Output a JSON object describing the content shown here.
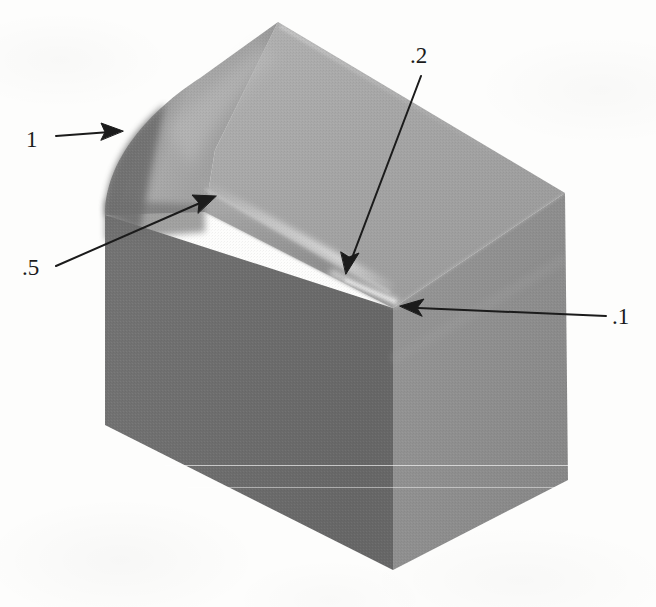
{
  "figure": {
    "domain": "technical-illustration",
    "background_color": "#fdfdfc",
    "canvas": {
      "width": 656,
      "height": 607
    }
  },
  "callouts": [
    {
      "id": "r1",
      "label": "1",
      "meaning": "fillet radius 1 on the upper-left vertical corner",
      "label_x": 26,
      "label_y": 128,
      "arrow": {
        "tail_x": 56,
        "tail_y": 136,
        "tip_x": 120,
        "tip_y": 131
      },
      "arrow_style": "straight-horizontal"
    },
    {
      "id": "r05",
      "label": ".5",
      "meaning": "fillet radius .5 on the left sloping edge",
      "label_x": 22,
      "label_y": 256,
      "arrow": {
        "tail_x": 56,
        "tail_y": 266,
        "tip_x": 215,
        "tip_y": 196
      },
      "arrow_style": "diagonal-up-right"
    },
    {
      "id": "r02",
      "label": ".2",
      "meaning": "fillet radius .2 on the front chamfer edge",
      "label_x": 410,
      "label_y": 44,
      "arrow": {
        "tail_x": 419,
        "tail_y": 73,
        "tip_x": 348,
        "tip_y": 272
      },
      "arrow_style": "diagonal-down-left"
    },
    {
      "id": "r01",
      "label": ".1",
      "meaning": "fillet radius .1 on the front vertical corner",
      "label_x": 612,
      "label_y": 305,
      "arrow": {
        "tail_x": 606,
        "tail_y": 316,
        "tip_x": 400,
        "tip_y": 306
      },
      "arrow_style": "straight-horizontal-left"
    }
  ],
  "shape": {
    "name": "filleted-block",
    "vertices": {
      "top_apex": {
        "x": 278,
        "y": 22
      },
      "top_right": {
        "x": 565,
        "y": 193
      },
      "front_vertex": {
        "x": 393,
        "y": 308
      },
      "left_upper": {
        "x": 105,
        "y": 215
      },
      "left_bottom": {
        "x": 105,
        "y": 425
      },
      "bottom_vertex": {
        "x": 393,
        "y": 570
      },
      "right_bottom": {
        "x": 568,
        "y": 480
      }
    },
    "faces": [
      {
        "name": "top-face",
        "fill": "#a3a3a3"
      },
      {
        "name": "left-front-face",
        "fill": "#6f6f6f"
      },
      {
        "name": "right-face",
        "fill": "#8f8f8f"
      },
      {
        "name": "left-fillet",
        "fill": "#9a9a9a"
      },
      {
        "name": "chamfer-band",
        "fill": "#989898"
      }
    ]
  },
  "artifacts": {
    "scan_lines": [
      {
        "y": 465,
        "x": 165,
        "width": 405
      },
      {
        "y": 487,
        "x": 188,
        "width": 382
      }
    ]
  },
  "colors": {
    "ink": "#1b1b1b",
    "paper": "#fdfdfc",
    "top_face": "#a3a3a3",
    "front_face": "#6f6f6f",
    "right_face": "#8f8f8f",
    "highlight_edge": "#d8d8d8"
  }
}
